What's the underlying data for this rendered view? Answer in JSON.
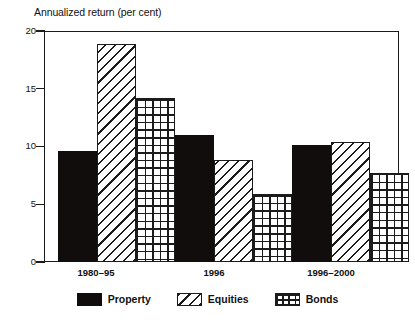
{
  "chart_data": {
    "type": "bar",
    "title": "Annualized return (per cent)",
    "xlabel": "",
    "ylabel": "Annualized return (per cent)",
    "ylim": [
      0,
      20
    ],
    "yticks": [
      0,
      5,
      10,
      15,
      20
    ],
    "ytick_labels": [
      "0",
      "5",
      "10",
      "15",
      "20"
    ],
    "grid": false,
    "legend_position": "bottom",
    "categories": [
      "1980–95",
      "1996",
      "1996–2000"
    ],
    "series": [
      {
        "name": "Property",
        "pattern": "solid",
        "values": [
          9.6,
          11.0,
          10.1
        ]
      },
      {
        "name": "Equities",
        "pattern": "diagonal-hatch",
        "values": [
          18.9,
          8.8,
          10.4
        ]
      },
      {
        "name": "Bonds",
        "pattern": "cross-hatch",
        "values": [
          14.2,
          5.9,
          7.7
        ]
      }
    ],
    "colors": {
      "axis": "#1b1b1b",
      "property": "#100d0c",
      "equities": "#ffffff",
      "bonds": "#ffffff",
      "background": "#ffffff"
    }
  },
  "legend": {
    "items": [
      {
        "label": "Property",
        "pattern": "solid"
      },
      {
        "label": "Equities",
        "pattern": "diagonal-hatch"
      },
      {
        "label": "Bonds",
        "pattern": "cross-hatch"
      }
    ]
  }
}
